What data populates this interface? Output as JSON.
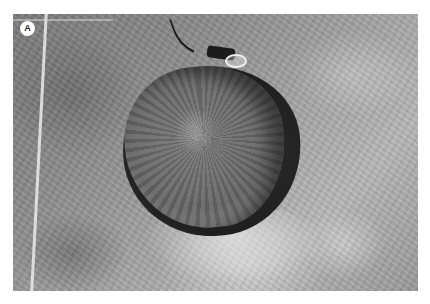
{
  "figure": {
    "label": "A",
    "colors": {
      "background": "#ffffff",
      "badge_fill": "#ffffff",
      "badge_text": "#2b2b2b",
      "terrain_tone": "#9a9a9a",
      "crater_shadow": "#1e1e1e"
    }
  }
}
